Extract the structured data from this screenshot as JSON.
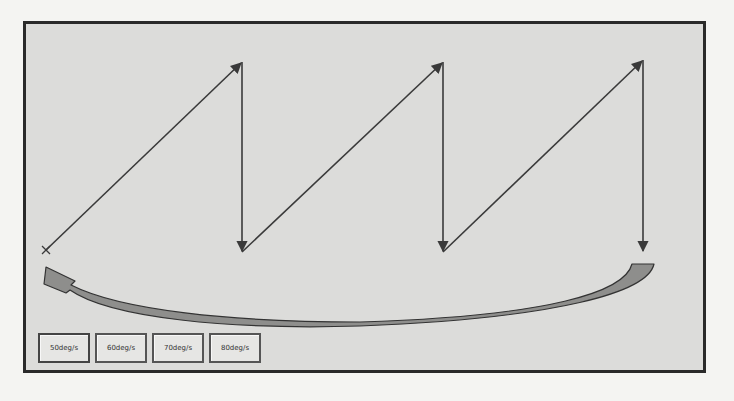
{
  "diagram": {
    "start_marker": "x",
    "path_points": [
      [
        46,
        250
      ],
      [
        242,
        62
      ],
      [
        242,
        252
      ],
      [
        443,
        62
      ],
      [
        443,
        252
      ],
      [
        643,
        60
      ],
      [
        643,
        252
      ]
    ],
    "return_arc": {
      "from": [
        650,
        265
      ],
      "to": [
        45,
        272
      ]
    },
    "colors": {
      "background": "#dcdcda",
      "frame": "#2a2a2a",
      "line": "#3a3a3a",
      "arc_fill": "#8e8e8c"
    }
  },
  "buttons": [
    {
      "label": "50deg/s"
    },
    {
      "label": "60deg/s"
    },
    {
      "label": "70deg/s"
    },
    {
      "label": "80deg/s"
    }
  ]
}
